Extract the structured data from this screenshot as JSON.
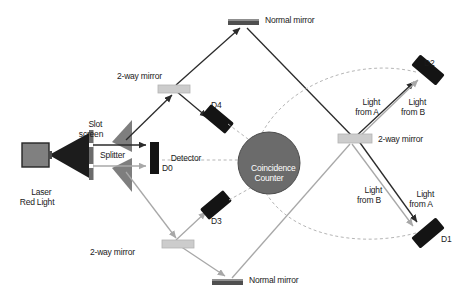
{
  "diagram": {
    "colors": {
      "beam_solid": "#2b2b2b",
      "beam_light": "#a8a8a8",
      "dashed_link": "#b0b0b0",
      "detector_black": "#141414",
      "normal_mirror": "#4f4f4f",
      "two_way_mirror": "#c9c9c9",
      "laser_body": "#808080",
      "splitter_gray": "#808080",
      "coincidence_fill": "#6b6b6b",
      "slot_screen": "#6b6b6b",
      "background": "#ffffff"
    },
    "labels": {
      "laser": "Laser\nRed Light",
      "slot_screen": "Slot\nscreen",
      "splitter": "Splitter",
      "detector_d0": "Detector\nD0",
      "two_way_mirror_top_left": "2-way mirror",
      "two_way_mirror_bottom_left": "2-way mirror",
      "two_way_mirror_right": "2-way mirror",
      "normal_mirror_top": "Normal mirror",
      "normal_mirror_bottom": "Normal mirror",
      "coincidence_counter": "Coincidence\nCounter",
      "detector_d1": "D1",
      "detector_d2": "D2",
      "detector_d3": "D3",
      "detector_d4": "D4",
      "light_from_a_upper": "Light\nfrom A",
      "light_from_b_upper": "Light\nfrom B",
      "light_from_b_lower": "Light\nfrom B",
      "light_from_a_lower": "Light\nfrom A"
    },
    "components": [
      {
        "id": "laser",
        "name": "laser-source",
        "label": "Laser\nRed Light",
        "shape": "rect",
        "x": 22,
        "y": 143,
        "w": 27,
        "h": 24
      },
      {
        "id": "slot-screen",
        "name": "slot-screen",
        "label": "Slot\nscreen",
        "shape": "bar-vertical",
        "x": 89,
        "y": 131,
        "w": 4,
        "h": 50
      },
      {
        "id": "splitter",
        "name": "beam-splitter",
        "label": "Splitter",
        "shape": "double-triangle",
        "x": 110,
        "y": 138,
        "w": 22,
        "h": 42
      },
      {
        "id": "detector-d0",
        "name": "detector-d0",
        "label": "Detector\nD0",
        "shape": "rect-black",
        "x": 150,
        "y": 142,
        "w": 9,
        "h": 32
      },
      {
        "id": "mirror-top",
        "name": "normal-mirror-top",
        "label": "Normal mirror",
        "shape": "bar-horizontal",
        "x": 228,
        "y": 19,
        "w": 30,
        "h": 6
      },
      {
        "id": "mirror-bottom",
        "name": "normal-mirror-bottom",
        "label": "Normal mirror",
        "shape": "bar-horizontal",
        "x": 212,
        "y": 279,
        "w": 30,
        "h": 6
      },
      {
        "id": "twm-top-left",
        "name": "two-way-mirror-top-left",
        "label": "2-way mirror",
        "shape": "bar-horizontal-light",
        "x": 158,
        "y": 85,
        "w": 30,
        "h": 8
      },
      {
        "id": "twm-bottom-left",
        "name": "two-way-mirror-bottom-left",
        "label": "2-way mirror",
        "shape": "bar-horizontal-light",
        "x": 162,
        "y": 240,
        "w": 30,
        "h": 8
      },
      {
        "id": "twm-right",
        "name": "two-way-mirror-right",
        "label": "2-way mirror",
        "shape": "bar-horizontal-light",
        "x": 340,
        "y": 134,
        "w": 30,
        "h": 8
      },
      {
        "id": "coincidence",
        "name": "coincidence-counter",
        "label": "Coincidence\nCounter",
        "shape": "circle",
        "cx": 269,
        "cy": 163,
        "r": 31
      },
      {
        "id": "detector-d1",
        "name": "detector-d1",
        "label": "D1",
        "shape": "rect-rotated",
        "x": 417,
        "y": 222,
        "w": 30,
        "h": 13,
        "rotate": -40
      },
      {
        "id": "detector-d2",
        "name": "detector-d2",
        "label": "D2",
        "shape": "rect-rotated",
        "x": 417,
        "y": 68,
        "w": 30,
        "h": 13,
        "rotate": 40
      },
      {
        "id": "detector-d3",
        "name": "detector-d3",
        "label": "D3",
        "shape": "rect-rotated",
        "x": 203,
        "y": 205,
        "w": 30,
        "h": 13,
        "rotate": -40
      },
      {
        "id": "detector-d4",
        "name": "detector-d4",
        "label": "D4",
        "shape": "rect-rotated",
        "x": 203,
        "y": 111,
        "w": 30,
        "h": 13,
        "rotate": 40
      }
    ],
    "beam_paths": [
      {
        "name": "laser-to-splitter-upper",
        "style": "solid-dark"
      },
      {
        "name": "laser-to-splitter-lower",
        "style": "light-gray"
      },
      {
        "name": "splitter-to-d0",
        "style": "solid-dark"
      },
      {
        "name": "path-a-up-to-two-way-mirror",
        "style": "solid-dark"
      },
      {
        "name": "two-way-mirror-to-d4",
        "style": "solid-dark"
      },
      {
        "name": "two-way-mirror-to-normal-mirror-top",
        "style": "solid-dark"
      },
      {
        "name": "normal-mirror-top-to-right-mirror",
        "style": "solid-dark"
      },
      {
        "name": "right-mirror-to-d2-from-a",
        "style": "solid-dark"
      },
      {
        "name": "right-mirror-to-d1-from-a",
        "style": "solid-dark"
      },
      {
        "name": "path-b-down-to-two-way-mirror",
        "style": "light-gray"
      },
      {
        "name": "two-way-mirror-to-d3",
        "style": "light-gray"
      },
      {
        "name": "two-way-mirror-to-normal-mirror-bottom",
        "style": "light-gray"
      },
      {
        "name": "normal-mirror-bottom-to-right-mirror",
        "style": "light-gray"
      },
      {
        "name": "right-mirror-to-d2-from-b",
        "style": "light-gray"
      },
      {
        "name": "right-mirror-to-d1-from-b",
        "style": "light-gray"
      }
    ],
    "coincidence_links": [
      {
        "name": "link-d0-to-counter"
      },
      {
        "name": "link-d4-to-counter"
      },
      {
        "name": "link-d3-to-counter"
      },
      {
        "name": "link-d2-to-counter"
      },
      {
        "name": "link-d1-to-counter"
      }
    ]
  }
}
